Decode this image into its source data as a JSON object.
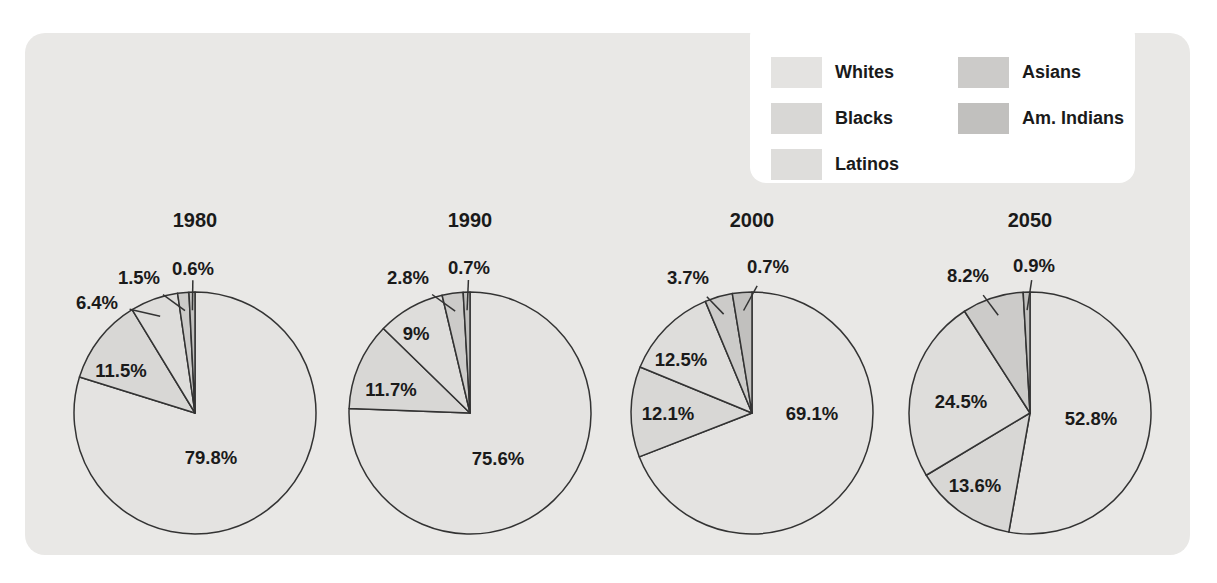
{
  "page": {
    "background": "#ffffff"
  },
  "panel": {
    "background": "#e9e8e6"
  },
  "legend": {
    "position": "top-right",
    "items": [
      {
        "id": "whites",
        "label": "Whites",
        "color": "#e4e3e1"
      },
      {
        "id": "blacks",
        "label": "Blacks",
        "color": "#d8d7d5"
      },
      {
        "id": "latinos",
        "label": "Latinos",
        "color": "#dedddb"
      },
      {
        "id": "asians",
        "label": "Asians",
        "color": "#cccbc9"
      },
      {
        "id": "am-indians",
        "label": "Am. Indians",
        "color": "#c1c0be"
      }
    ]
  },
  "chart_data": [
    {
      "type": "pie",
      "title": "1980",
      "categories": [
        "Whites",
        "Blacks",
        "Latinos",
        "Asians",
        "Am. Indians"
      ],
      "values": [
        79.8,
        11.5,
        6.4,
        1.5,
        0.6
      ],
      "value_labels": [
        "79.8%",
        "11.5%",
        "6.4%",
        "1.5%",
        "0.6%"
      ]
    },
    {
      "type": "pie",
      "title": "1990",
      "categories": [
        "Whites",
        "Blacks",
        "Latinos",
        "Asians",
        "Am. Indians"
      ],
      "values": [
        75.6,
        11.7,
        9,
        2.8,
        0.7
      ],
      "value_labels": [
        "75.6%",
        "11.7%",
        "9%",
        "2.8%",
        "0.7%"
      ]
    },
    {
      "type": "pie",
      "title": "2000",
      "categories": [
        "Whites",
        "Blacks",
        "Latinos",
        "Asians",
        "Am. Indians"
      ],
      "values": [
        69.1,
        12.1,
        12.5,
        3.7,
        0.7
      ],
      "value_labels": [
        "69.1%",
        "12.1%",
        "12.5%",
        "3.7%",
        "0.7%"
      ]
    },
    {
      "type": "pie",
      "title": "2050",
      "categories": [
        "Whites",
        "Blacks",
        "Latinos",
        "Asians",
        "Am. Indians"
      ],
      "values": [
        52.8,
        13.6,
        24.5,
        8.2,
        0.9
      ],
      "value_labels": [
        "52.8%",
        "13.6%",
        "24.5%",
        "8.2%",
        "0.9%"
      ]
    }
  ]
}
